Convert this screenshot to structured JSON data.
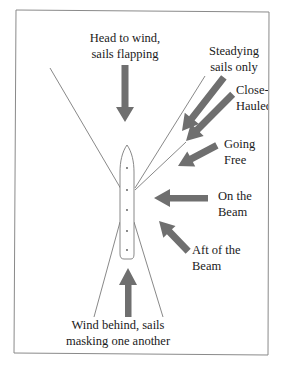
{
  "diagram": {
    "colors": {
      "frame": "#8a8a8a",
      "line": "#7a7a7a",
      "arrow": "#6f6f6f",
      "text": "#1a1a1a",
      "background": "#ffffff"
    },
    "labels": {
      "head_to_wind": {
        "line1": "Head to wind,",
        "line2": "sails flapping"
      },
      "steadying": {
        "line1": "Steadying",
        "line2": "sails only"
      },
      "close_hauled": {
        "line1": "Close-",
        "line2": "Hauled"
      },
      "going_free": {
        "line1": "Going",
        "line2": "Free"
      },
      "on_the_beam": {
        "line1": "On the",
        "line2": "Beam"
      },
      "aft_of_beam": {
        "line1": "Aft of the",
        "line2": "Beam"
      },
      "wind_behind": {
        "line1": "Wind behind, sails",
        "line2": "masking one another"
      }
    },
    "arrows": [
      {
        "id": "head-to-wind",
        "direction": "down"
      },
      {
        "id": "steadying",
        "direction": "down-left"
      },
      {
        "id": "close-hauled",
        "direction": "down-left"
      },
      {
        "id": "going-free",
        "direction": "left-down"
      },
      {
        "id": "on-the-beam",
        "direction": "left"
      },
      {
        "id": "aft-of-beam",
        "direction": "up-left"
      },
      {
        "id": "wind-behind",
        "direction": "up"
      }
    ]
  }
}
